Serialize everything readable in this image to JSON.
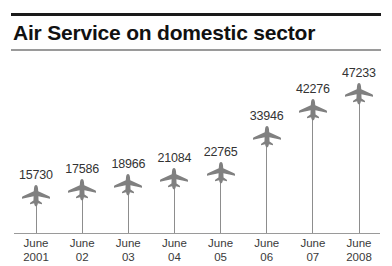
{
  "title": "Air Service on domestic sector",
  "icons": {
    "plane": "airplane-icon"
  },
  "chart_data": {
    "type": "bar",
    "title": "Air Service on domestic sector",
    "xlabel": "",
    "ylabel": "",
    "grid": false,
    "legend": false,
    "marker_style": "airplane-pictogram-on-stem",
    "categories": [
      "June 2001",
      "June 02",
      "June 03",
      "June 04",
      "June 05",
      "June 06",
      "June 07",
      "June 2008"
    ],
    "category_lines": [
      [
        "June",
        "2001"
      ],
      [
        "June",
        "02"
      ],
      [
        "June",
        "03"
      ],
      [
        "June",
        "04"
      ],
      [
        "June",
        "05"
      ],
      [
        "June",
        "06"
      ],
      [
        "June",
        "07"
      ],
      [
        "June",
        "2008"
      ]
    ],
    "values": [
      15730,
      17586,
      18966,
      21084,
      22765,
      33946,
      42276,
      47233
    ],
    "value_labels": [
      "15730",
      "17586",
      "18966",
      "21084",
      "22765",
      "33946",
      "42276",
      "47233"
    ],
    "ylim": [
      0,
      52000
    ]
  },
  "colors": {
    "title_text": "#111111",
    "rule_top": "#1a1a1a",
    "rule_bottom": "#9a9a9a",
    "axis": "#9a9a9a",
    "plane": "#808080",
    "stem": "#8d8d8d",
    "value_text": "#333333",
    "tick_text": "#3a3a3a",
    "background": "#ffffff"
  }
}
